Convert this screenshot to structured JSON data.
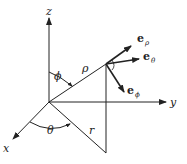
{
  "diagram": {
    "axes": {
      "x": "x",
      "y": "y",
      "z": "z"
    },
    "labels": {
      "rho": "ρ",
      "r": "r",
      "theta": "θ",
      "phi": "ϕ"
    },
    "vectors": [
      {
        "base": "e",
        "sub": "ρ"
      },
      {
        "base": "e",
        "sub": "θ"
      },
      {
        "base": "e",
        "sub": "ϕ"
      }
    ],
    "color": "#222222"
  }
}
